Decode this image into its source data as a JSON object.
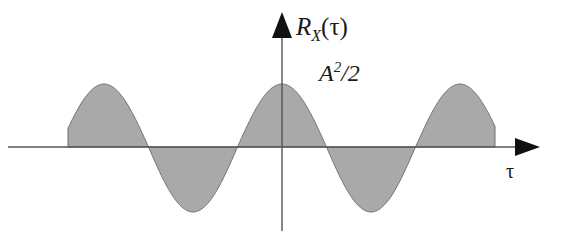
{
  "figure": {
    "background_color": "#ffffff",
    "width": 563,
    "height": 246
  },
  "axes": {
    "y_axis": {
      "label": "R",
      "label_subscript": "X",
      "label_argument": "(τ)",
      "full_label": "R_X(τ)",
      "color": "#555555",
      "arrow_color": "#111111",
      "x_position": 282,
      "top": 22,
      "bottom": 231
    },
    "x_axis": {
      "label": "τ",
      "color": "#555555",
      "arrow_color": "#111111",
      "y_position": 147,
      "left": 8,
      "right": 537
    }
  },
  "annotations": [
    {
      "name": "peak-amplitude-label",
      "base": "A",
      "exponent": "2",
      "divisor": "/2",
      "text": "A²/2",
      "x": 319,
      "y": 60
    }
  ],
  "chart_data": {
    "type": "line",
    "title": "",
    "xlabel": "τ",
    "ylabel": "R_X(τ)",
    "subtype": "filled-cosine-autocorrelation",
    "function": "R_X(tau) = (A^2/2) * cos(2*pi*tau/T)",
    "fill_color": "#a9a9a9",
    "stroke_color": "#6e6e6e",
    "grid": false,
    "legend": null,
    "peak_value_label": "A²/2",
    "amplitude_px_up": 63,
    "amplitude_px_down": 65,
    "period_px": 178,
    "baseline_y_px": 147,
    "origin_x_px": 282,
    "curve_start_x_px": 68,
    "curve_end_x_px": 495,
    "zero_crossings_px": [
      68,
      148,
      237,
      327,
      416,
      495
    ],
    "peaks_px": [
      {
        "x": 104,
        "y": 84,
        "type": "max"
      },
      {
        "x": 282,
        "y": 84,
        "type": "max"
      },
      {
        "x": 460,
        "y": 84,
        "type": "max"
      }
    ],
    "troughs_px": [
      {
        "x": 193,
        "y": 212,
        "type": "min"
      },
      {
        "x": 371,
        "y": 212,
        "type": "min"
      }
    ],
    "x": [
      -1.2,
      -1.15,
      -1.1,
      -1.05,
      -1.0,
      -0.95,
      -0.9,
      -0.85,
      -0.8,
      -0.75,
      -0.7,
      -0.65,
      -0.6,
      -0.55,
      -0.5,
      -0.45,
      -0.4,
      -0.35,
      -0.3,
      -0.25,
      -0.2,
      -0.15,
      -0.1,
      -0.05,
      0.0,
      0.05,
      0.1,
      0.15,
      0.2,
      0.25,
      0.3,
      0.35,
      0.4,
      0.45,
      0.5,
      0.55,
      0.6,
      0.65,
      0.7,
      0.75,
      0.8,
      0.85,
      0.9,
      0.95,
      1.0,
      1.05,
      1.1,
      1.15,
      1.2
    ],
    "values": [
      0.0,
      0.156,
      0.309,
      0.454,
      0.588,
      0.707,
      0.809,
      0.891,
      0.951,
      0.988,
      1.0,
      0.988,
      0.951,
      0.891,
      0.809,
      0.707,
      0.588,
      0.454,
      0.309,
      0.156,
      0.0,
      -0.156,
      -0.309,
      -0.454,
      -0.588,
      -0.707,
      -0.809,
      -0.891,
      -0.951,
      -0.988,
      -1.0,
      -0.988,
      -0.951,
      -0.891,
      -0.809,
      -0.707,
      -0.588,
      -0.454,
      -0.309,
      -0.156,
      0.0,
      0.156,
      0.309,
      0.454,
      0.588,
      0.707,
      0.809,
      0.891,
      0.951
    ],
    "ylim": [
      -1.05,
      1.05
    ],
    "xlim": [
      -1.4,
      1.4
    ]
  }
}
